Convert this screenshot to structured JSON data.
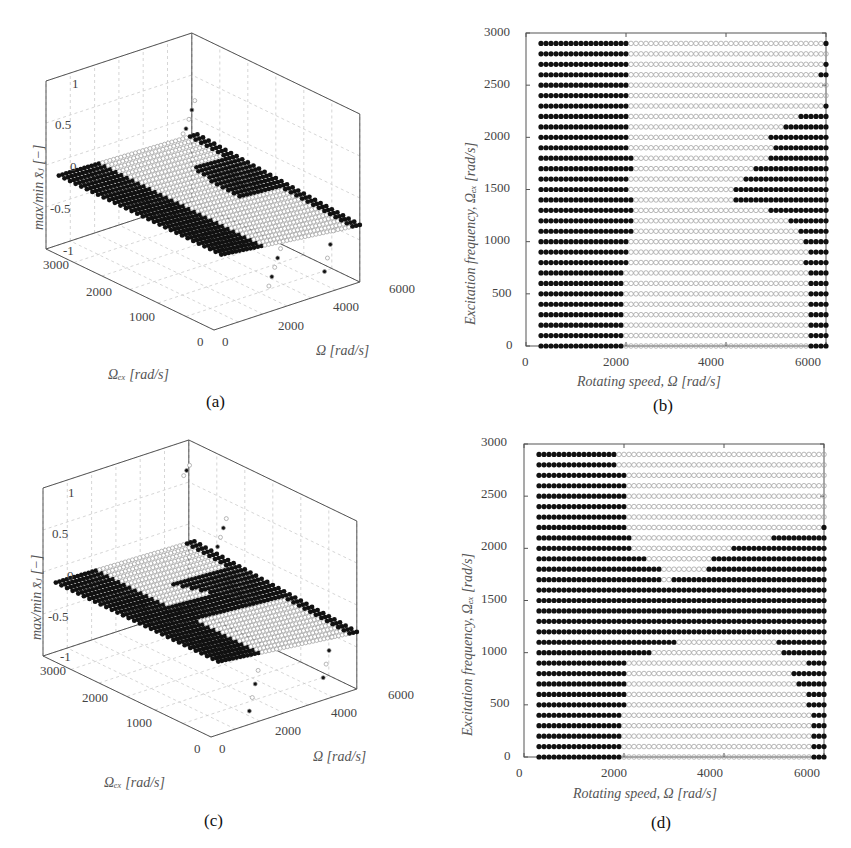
{
  "figure": {
    "panels": [
      {
        "id": "a",
        "caption": "(a)"
      },
      {
        "id": "b",
        "caption": "(b)"
      },
      {
        "id": "c",
        "caption": "(c)"
      },
      {
        "id": "d",
        "caption": "(d)"
      }
    ]
  },
  "panel_a": {
    "caption": "(a)",
    "zlabel": "max/min x̄ⱼ [−]",
    "xlabel": "Ω [rad/s]",
    "ylabel": "Ωₑₓ [rad/s]",
    "zticks": [
      "1",
      "0.5",
      "0",
      "-0.5",
      "-1"
    ],
    "xticks": [
      "0",
      "2000",
      "4000",
      "6000"
    ],
    "yticks": [
      "0",
      "1000",
      "2000",
      "3000"
    ]
  },
  "panel_b": {
    "caption": "(b)",
    "xlabel": "Rotating speed, Ω [rad/s]",
    "ylabel": "Excitation frequency, Ωₑₓ [rad/s]",
    "xticks": [
      "0",
      "2000",
      "4000",
      "6000"
    ],
    "yticks": [
      "0",
      "500",
      "1000",
      "1500",
      "2000",
      "2500",
      "3000"
    ]
  },
  "panel_c": {
    "caption": "(c)",
    "zlabel": "max/min x̄ⱼ [−]",
    "xlabel": "Ω [rad/s]",
    "ylabel": "Ωₑₓ [rad/s]",
    "zticks": [
      "1",
      "0.5",
      "0",
      "-0.5",
      "-1"
    ],
    "xticks": [
      "0",
      "2000",
      "4000",
      "6000"
    ],
    "yticks": [
      "0",
      "1000",
      "2000",
      "3000"
    ]
  },
  "panel_d": {
    "caption": "(d)",
    "xlabel": "Rotating speed, Ω [rad/s]",
    "ylabel": "Excitation frequency, Ωₑₓ [rad/s]",
    "xticks": [
      "0",
      "2000",
      "4000",
      "6000"
    ],
    "yticks": [
      "0",
      "500",
      "1000",
      "1500",
      "2000",
      "2500",
      "3000"
    ]
  },
  "colors": {
    "stable_marker": "#111111",
    "unstable_marker": "#9a9a9a",
    "axis": "#555555",
    "grid": "#cccccc"
  },
  "chart_data": [
    {
      "id": "a",
      "type": "scatter",
      "subtype": "3d-scatter",
      "title": "",
      "xlabel": "Ω [rad/s]",
      "ylabel": "Ωex [rad/s]",
      "zlabel": "max/min x̄j [−]",
      "xlim": [
        0,
        6000
      ],
      "ylim": [
        0,
        3000
      ],
      "zlim": [
        -1,
        1
      ],
      "grid": true,
      "description": "Max/min response amplitude over (Ω, Ωex) grid; filled markers = one solution type, open markers = other; mostly flat near z≈0 to -0.3 with divergent branches near Ω≈5000-6000"
    },
    {
      "id": "b",
      "type": "scatter",
      "title": "",
      "xlabel": "Rotating speed, Ω [rad/s]",
      "ylabel": "Excitation frequency, Ωex [rad/s]",
      "xlim": [
        0,
        6000
      ],
      "ylim": [
        0,
        3000
      ],
      "x_start": 300,
      "x_end": 6000,
      "x_step": 100,
      "grid": false,
      "legend": {
        "filled": "filled marker",
        "open": "open marker"
      },
      "rows": [
        {
          "y": 0,
          "filled_left_to": 1900,
          "filled_right_from": 5700
        },
        {
          "y": 100,
          "filled_left_to": 1900,
          "filled_right_from": 5700
        },
        {
          "y": 200,
          "filled_left_to": 1900,
          "filled_right_from": 5700
        },
        {
          "y": 300,
          "filled_left_to": 1900,
          "filled_right_from": 5700
        },
        {
          "y": 400,
          "filled_left_to": 1900,
          "filled_right_from": 5700
        },
        {
          "y": 500,
          "filled_left_to": 1900,
          "filled_right_from": 5700
        },
        {
          "y": 600,
          "filled_left_to": 1900,
          "filled_right_from": 5700
        },
        {
          "y": 700,
          "filled_left_to": 1900,
          "filled_right_from": 5700
        },
        {
          "y": 800,
          "filled_left_to": 2000,
          "filled_right_from": 5600
        },
        {
          "y": 900,
          "filled_left_to": 2000,
          "filled_right_from": 5700
        },
        {
          "y": 1000,
          "filled_left_to": 2000,
          "filled_right_from": 5600
        },
        {
          "y": 1100,
          "filled_left_to": 2100,
          "filled_right_from": 5500
        },
        {
          "y": 1200,
          "filled_left_to": 2100,
          "filled_right_from": 5300
        },
        {
          "y": 1300,
          "filled_left_to": 2100,
          "filled_right_from": 4900
        },
        {
          "y": 1400,
          "filled_left_to": 2100,
          "filled_right_from": 4200
        },
        {
          "y": 1500,
          "filled_left_to": 2000,
          "filled_right_from": 4200
        },
        {
          "y": 1600,
          "filled_left_to": 2000,
          "filled_right_from": 4400
        },
        {
          "y": 1700,
          "filled_left_to": 2100,
          "filled_right_from": 4600
        },
        {
          "y": 1800,
          "filled_left_to": 2100,
          "filled_right_from": 4900
        },
        {
          "y": 1900,
          "filled_left_to": 2000,
          "filled_right_from": 5000
        },
        {
          "y": 2000,
          "filled_left_to": 2000,
          "filled_right_from": 4900
        },
        {
          "y": 2100,
          "filled_left_to": 2000,
          "filled_right_from": 5200
        },
        {
          "y": 2200,
          "filled_left_to": 2000,
          "filled_right_from": 5500
        },
        {
          "y": 2300,
          "filled_left_to": 2000,
          "filled_right_from": 6000
        },
        {
          "y": 2400,
          "filled_left_to": 2000,
          "filled_right_from": null
        },
        {
          "y": 2500,
          "filled_left_to": 2000,
          "filled_right_from": null
        },
        {
          "y": 2600,
          "filled_left_to": 2000,
          "filled_right_from": 5900
        },
        {
          "y": 2700,
          "filled_left_to": 2000,
          "filled_right_from": 6000
        },
        {
          "y": 2800,
          "filled_left_to": 2000,
          "filled_right_from": null
        },
        {
          "y": 2900,
          "filled_left_to": 2000,
          "filled_right_from": 6000
        }
      ]
    },
    {
      "id": "c",
      "type": "scatter",
      "subtype": "3d-scatter",
      "title": "",
      "xlabel": "Ω [rad/s]",
      "ylabel": "Ωex [rad/s]",
      "zlabel": "max/min x̄j [−]",
      "xlim": [
        0,
        6000
      ],
      "ylim": [
        0,
        3000
      ],
      "zlim": [
        -1,
        1
      ],
      "grid": true,
      "description": "Same as (a) for second configuration; larger filled region through mid excitation frequencies, scattered branches reaching z≈0.8 and z≈-1 near Ω≈6000"
    },
    {
      "id": "d",
      "type": "scatter",
      "title": "",
      "xlabel": "Rotating speed, Ω [rad/s]",
      "ylabel": "Excitation frequency, Ωex [rad/s]",
      "xlim": [
        0,
        6000
      ],
      "ylim": [
        0,
        3000
      ],
      "x_start": 300,
      "x_end": 6000,
      "x_step": 100,
      "grid": false,
      "rows": [
        {
          "y": 0,
          "filled_left_to": 1900,
          "filled_right_from": 5800
        },
        {
          "y": 100,
          "filled_left_to": 1900,
          "filled_right_from": 5800
        },
        {
          "y": 200,
          "filled_left_to": 1900,
          "filled_right_from": 5800
        },
        {
          "y": 300,
          "filled_left_to": 1900,
          "filled_right_from": 5800
        },
        {
          "y": 400,
          "filled_left_to": 1900,
          "filled_right_from": 5800
        },
        {
          "y": 500,
          "filled_left_to": 2000,
          "filled_right_from": 5700
        },
        {
          "y": 600,
          "filled_left_to": 2000,
          "filled_right_from": 5700
        },
        {
          "y": 700,
          "filled_left_to": 2000,
          "filled_right_from": 5500
        },
        {
          "y": 800,
          "filled_left_to": 2000,
          "filled_right_from": 5400
        },
        {
          "y": 900,
          "filled_left_to": 2000,
          "filled_right_from": 5700
        },
        {
          "y": 1000,
          "filled_left_to": 2500,
          "filled_right_from": 5200
        },
        {
          "y": 1100,
          "filled_left_to": 3000,
          "filled_right_from": 5100
        },
        {
          "y": 1200,
          "filled_left_to": 6000,
          "filled_right_from": null
        },
        {
          "y": 1300,
          "filled_left_to": 6000,
          "filled_right_from": null
        },
        {
          "y": 1400,
          "filled_left_to": 6000,
          "filled_right_from": null
        },
        {
          "y": 1500,
          "filled_left_to": 6000,
          "filled_right_from": null
        },
        {
          "y": 1600,
          "filled_left_to": 6000,
          "filled_right_from": null
        },
        {
          "y": 1700,
          "filled_left_to": 2700,
          "filled_right_from": 3000
        },
        {
          "y": 1800,
          "filled_left_to": 2700,
          "filled_right_from": 3700
        },
        {
          "y": 1900,
          "filled_left_to": 2400,
          "filled_right_from": 3800
        },
        {
          "y": 2000,
          "filled_left_to": 2100,
          "filled_right_from": 4200
        },
        {
          "y": 2100,
          "filled_left_to": 2100,
          "filled_right_from": 5000
        },
        {
          "y": 2200,
          "filled_left_to": 2000,
          "filled_right_from": 6000
        },
        {
          "y": 2300,
          "filled_left_to": 2000,
          "filled_right_from": null
        },
        {
          "y": 2400,
          "filled_left_to": 2000,
          "filled_right_from": null
        },
        {
          "y": 2500,
          "filled_left_to": 2000,
          "filled_right_from": null
        },
        {
          "y": 2600,
          "filled_left_to": 2000,
          "filled_right_from": null
        },
        {
          "y": 2700,
          "filled_left_to": 2000,
          "filled_right_from": null
        },
        {
          "y": 2800,
          "filled_left_to": 1800,
          "filled_right_from": null
        },
        {
          "y": 2900,
          "filled_left_to": 1800,
          "filled_right_from": null
        }
      ]
    }
  ]
}
